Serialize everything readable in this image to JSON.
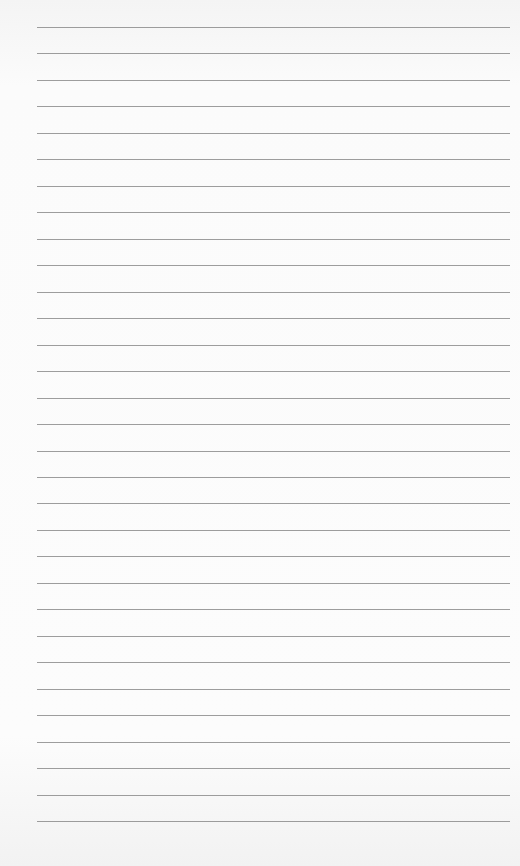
{
  "page": {
    "type": "lined-paper",
    "line_count": 31,
    "first_line_y": 27,
    "line_spacing": 26.47,
    "line_left": 37,
    "line_width": 473,
    "line_color": "#8c8c8c",
    "paper_color": "#fbfbfb"
  }
}
